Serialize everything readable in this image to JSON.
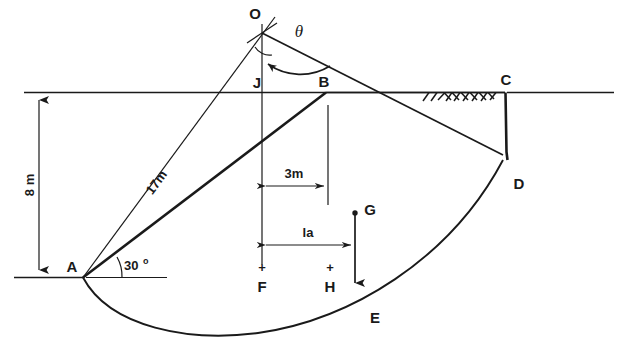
{
  "figure": {
    "ink_color": "#1a1a1a",
    "background_color": "#ffffff"
  },
  "points": {
    "O": "O",
    "J": "J",
    "B": "B",
    "C": "C",
    "D": "D",
    "E": "E",
    "F": "F",
    "G": "G",
    "H": "H",
    "A": "A"
  },
  "dimensions": {
    "depth": "8 m",
    "radius": "17m",
    "offset_3m": "3m",
    "lever_arm": "la"
  },
  "angles": {
    "theta": "θ",
    "slope_angle_value": "30",
    "slope_angle_unit": "o"
  },
  "marks": {
    "cross_f": "+",
    "cross_h": "+"
  }
}
